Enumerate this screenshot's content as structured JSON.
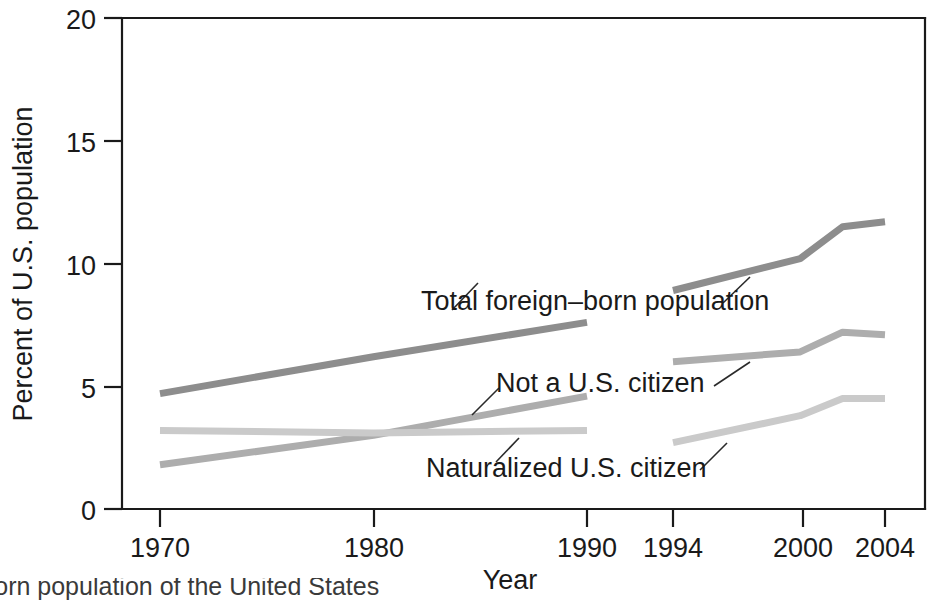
{
  "chart_data": {
    "type": "line",
    "title": "",
    "xlabel": "Year",
    "ylabel": "Percent of U.S. population",
    "ylim": [
      0,
      20
    ],
    "yticks": [
      0,
      5,
      10,
      15,
      20
    ],
    "ytick_labels": [
      "0",
      "5",
      "10",
      "15",
      "20"
    ],
    "xticks": [
      1970,
      1980,
      1990,
      1994,
      2000,
      2004
    ],
    "xtick_labels": [
      "1970",
      "1980",
      "1990",
      "1994",
      "2000",
      "2004"
    ],
    "axis_break": "between 1990 and 1994",
    "grid": false,
    "legend": "inline-annotations",
    "series": [
      {
        "name": "Total foreign-born population",
        "label": "Total foreign–born population",
        "color": "#8d8d8d",
        "segments": [
          {
            "x": [
              1970,
              1980,
              1990
            ],
            "y": [
              4.7,
              6.2,
              7.6
            ]
          },
          {
            "x": [
              1994,
              2000,
              2002,
              2004
            ],
            "y": [
              8.9,
              10.2,
              11.5,
              11.7
            ]
          }
        ]
      },
      {
        "name": "Not a U.S. citizen",
        "label": "Not a U.S. citizen",
        "color": "#adadad",
        "segments": [
          {
            "x": [
              1970,
              1980,
              1990
            ],
            "y": [
              1.8,
              3.0,
              4.6
            ]
          },
          {
            "x": [
              1994,
              2000,
              2002,
              2004
            ],
            "y": [
              6.0,
              6.4,
              7.2,
              7.1
            ]
          }
        ]
      },
      {
        "name": "Naturalized U.S. citizen",
        "label": "Naturalized U.S. citizen",
        "color": "#cacaca",
        "segments": [
          {
            "x": [
              1970,
              1980,
              1990
            ],
            "y": [
              3.2,
              3.1,
              3.2
            ]
          },
          {
            "x": [
              1994,
              2000,
              2002,
              2004
            ],
            "y": [
              2.7,
              3.8,
              4.5,
              4.5
            ]
          }
        ]
      }
    ],
    "annotations": [
      {
        "text": "Total foreign–born population",
        "series": "Total foreign-born population"
      },
      {
        "text": "Not a U.S. citizen",
        "series": "Not a U.S. citizen"
      },
      {
        "text": "Naturalized U.S. citizen",
        "series": "Naturalized U.S. citizen"
      }
    ]
  },
  "caption": {
    "text": "-born population of the United States"
  }
}
